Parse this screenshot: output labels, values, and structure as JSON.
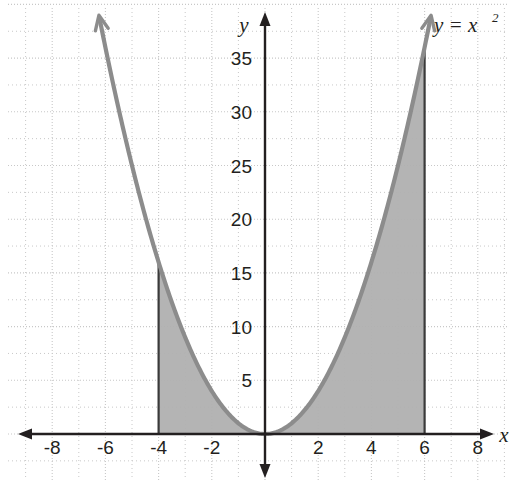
{
  "chart_data": {
    "type": "line",
    "title": "",
    "subtitle": "",
    "xlabel": "x",
    "ylabel": "y",
    "equation_label": "y = x",
    "equation_exponent": "2",
    "function": "y = x^2",
    "xlim": [
      -8.9,
      8.9
    ],
    "ylim": [
      -2.0,
      40.5
    ],
    "x_ticks": [
      -8,
      -6,
      -4,
      -2,
      2,
      4,
      6,
      8
    ],
    "x_tick_labels": [
      "-8",
      "-6",
      "-4",
      "-2",
      "2",
      "4",
      "6",
      "8"
    ],
    "y_ticks": [
      5,
      10,
      15,
      20,
      25,
      30,
      35
    ],
    "y_tick_labels": [
      "5",
      "10",
      "15",
      "20",
      "25",
      "30",
      "35"
    ],
    "grid": true,
    "grid_major_x_step": 2,
    "grid_minor_x_step": 1,
    "grid_major_y_step": 5,
    "grid_minor_y_step": 2.5,
    "legend": "none",
    "series": [
      {
        "name": "y = x^2",
        "type": "parabola",
        "x": [
          -6.2,
          -6.0,
          -5.5,
          -5.0,
          -4.5,
          -4.0,
          -3.5,
          -3.0,
          -2.5,
          -2.0,
          -1.5,
          -1.0,
          -0.5,
          0,
          0.5,
          1.0,
          1.5,
          2.0,
          2.5,
          3.0,
          3.5,
          4.0,
          4.5,
          5.0,
          5.5,
          6.0,
          6.2
        ],
        "values": [
          38.44,
          36,
          30.25,
          25,
          20.25,
          16,
          12.25,
          9,
          6.25,
          4,
          2.25,
          1,
          0.25,
          0,
          0.25,
          1,
          2.25,
          4,
          6.25,
          9,
          12.25,
          16,
          20.25,
          25,
          30.25,
          36,
          38.44
        ],
        "arrow_start": true,
        "arrow_end": true
      }
    ],
    "shaded_region": {
      "label": "area under curve",
      "x_from": -4,
      "x_to": 6,
      "y_from": 0,
      "curve": "y = x^2",
      "y_at_x_from": 16,
      "y_at_x_to": 36
    },
    "colors": {
      "curve": "#8c8c8c",
      "shading": "#b0b0b0",
      "axis": "#231f20",
      "grid": "#c8c8c8",
      "background": "#ffffff",
      "text": "#231f20"
    }
  }
}
